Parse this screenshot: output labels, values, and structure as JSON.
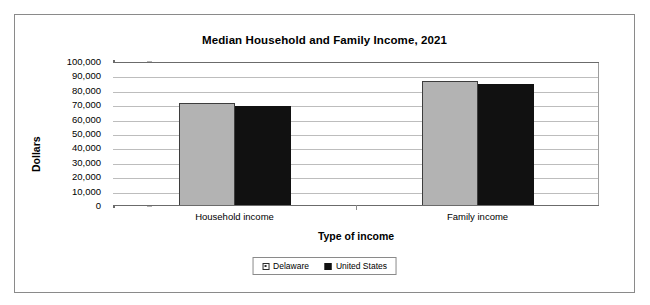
{
  "chart_data": {
    "type": "bar",
    "title": "Median Household and Family Income, 2021",
    "xlabel": "Type of income",
    "ylabel": "Dollars",
    "categories": [
      "Household income",
      "Family income"
    ],
    "series": [
      {
        "name": "Delaware",
        "values": [
          71000,
          86000
        ],
        "color": "#b3b3b3"
      },
      {
        "name": "United States",
        "values": [
          69000,
          84000
        ],
        "color": "#111111"
      }
    ],
    "ylim": [
      0,
      100000
    ],
    "ytick_values": [
      100000,
      90000,
      80000,
      70000,
      60000,
      50000,
      40000,
      30000,
      20000,
      10000,
      0
    ],
    "ytick_labels": [
      "100,000",
      "90,000",
      "80,000",
      "70,000",
      "60,000",
      "50,000",
      "40,000",
      "30,000",
      "20,000",
      "10,000",
      "0"
    ],
    "grid": true,
    "legend_position": "bottom",
    "legend_entries": [
      "Delaware",
      "United States"
    ]
  },
  "figure": {
    "border_color": "#8a8a8a",
    "background": "#ffffff"
  }
}
